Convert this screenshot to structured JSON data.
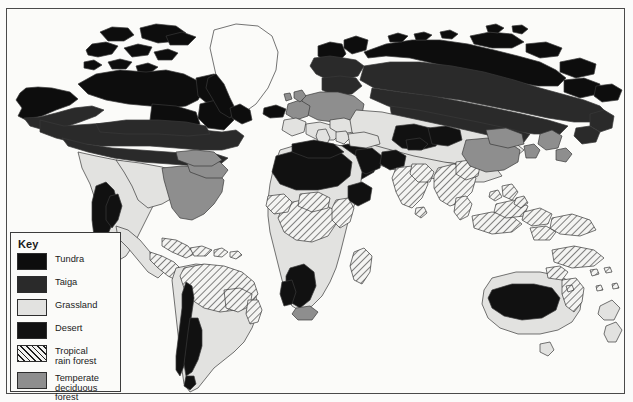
{
  "map": {
    "title": "World Biomes Map",
    "background_color": "#fbfbf9",
    "border_color": "#4a4a4a",
    "ocean_color": "#fbfbf9",
    "coastline_color": "#3a3a3a"
  },
  "legend": {
    "title": "Key",
    "items": [
      {
        "label": "Tundra",
        "swatch": "solid-black",
        "color": "#0d0d0d",
        "pattern": "solid"
      },
      {
        "label": "Taiga",
        "swatch": "dark-gray",
        "color": "#2a2a2a",
        "pattern": "solid"
      },
      {
        "label": "Grassland",
        "swatch": "light-gray",
        "color": "#e2e2e0",
        "pattern": "solid"
      },
      {
        "label": "Desert",
        "swatch": "black",
        "color": "#111111",
        "pattern": "solid"
      },
      {
        "label": "Tropical\nrain forest",
        "swatch": "diagonal-hatch",
        "color": "#1d1d1d",
        "pattern": "hatch-45"
      },
      {
        "label": "Temperate\ndeciduous forest",
        "swatch": "medium-gray",
        "color": "#8e8e8e",
        "pattern": "solid"
      }
    ]
  },
  "regions": {
    "tundra": "Arctic coasts of North America, Canadian Arctic Archipelago, Greenland coasts, Iceland, northern Scandinavia and the Siberian Arctic coast",
    "taiga": "Broad band across central Canada and Alaska, Scandinavia and across Siberia to Kamchatka",
    "grassland": "Great Plains of North America, pampas of South America, Sahel and southern African savanna, Eurasian steppe, interior Australia",
    "desert": "Southwestern North America, Atacama and Patagonian belts, Sahara, Arabian, Kalahari, Namib, Gobi, Thar and central Australia",
    "tropical_rain_forest": "Amazon basin, Central America, Congo basin, West Africa, Madagascar, India, Southeast Asia, Indonesia, New Guinea and northeast Australia",
    "temperate_deciduous_forest": "Eastern North America, western and central Europe, eastern China, Korea and Japan"
  }
}
